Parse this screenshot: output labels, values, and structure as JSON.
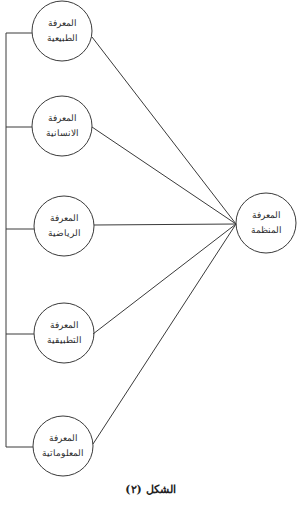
{
  "diagram": {
    "stroke_color": "#3a3a3a",
    "nodes": [
      {
        "id": "natural",
        "line1": "المعرفة",
        "line2": "الطبيعية",
        "cx": 62,
        "cy": 31
      },
      {
        "id": "human",
        "line1": "المعرفة",
        "line2": "الانسانية",
        "cx": 62,
        "cy": 126
      },
      {
        "id": "math",
        "line1": "المعرفة",
        "line2": "الرياضية",
        "cx": 64,
        "cy": 226
      },
      {
        "id": "applied",
        "line1": "المعرفة",
        "line2": "التطبيقية",
        "cx": 64,
        "cy": 333
      },
      {
        "id": "informatics",
        "line1": "المعرفة",
        "line2": "المعلوماتية",
        "cx": 63,
        "cy": 446
      }
    ],
    "target": {
      "id": "organized",
      "line1": "المعرفة",
      "line2": "المنظمة",
      "cx": 266,
      "cy": 223
    },
    "caption": "الشكل (٢)"
  }
}
